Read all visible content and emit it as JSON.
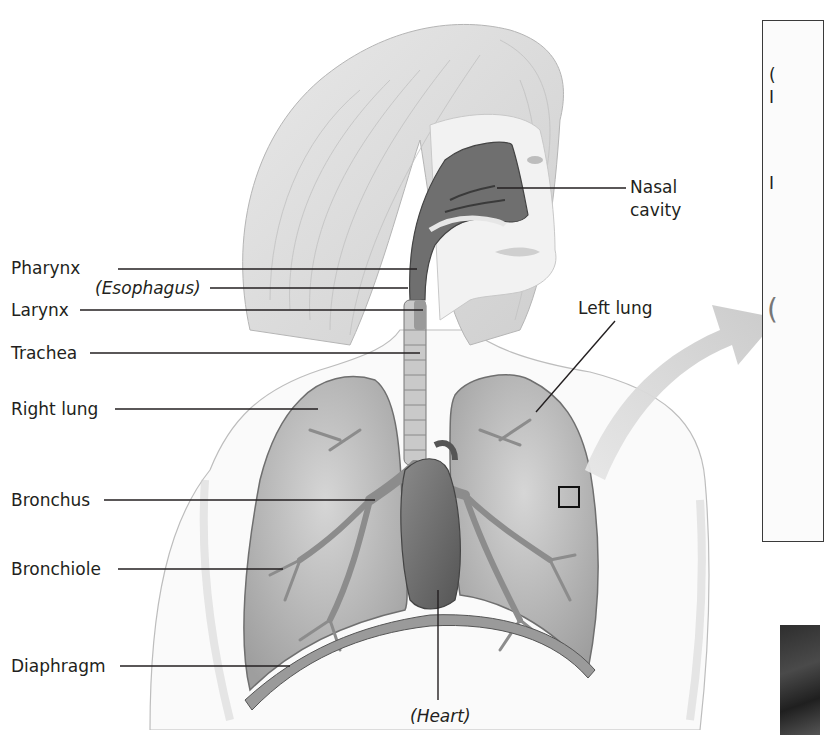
{
  "figure": {
    "labels_left": [
      {
        "id": "pharynx",
        "text": "Pharynx",
        "italic": false
      },
      {
        "id": "esophagus",
        "text": "(Esophagus)",
        "italic": true
      },
      {
        "id": "larynx",
        "text": "Larynx",
        "italic": false
      },
      {
        "id": "trachea",
        "text": "Trachea",
        "italic": false
      },
      {
        "id": "right-lung",
        "text": "Right lung",
        "italic": false
      },
      {
        "id": "bronchus",
        "text": "Bronchus",
        "italic": false
      },
      {
        "id": "bronchiole",
        "text": "Bronchiole",
        "italic": false
      },
      {
        "id": "diaphragm",
        "text": "Diaphragm",
        "italic": false
      }
    ],
    "labels_right": [
      {
        "id": "nasal-cavity",
        "line1": "Nasal",
        "line2": "cavity"
      },
      {
        "id": "left-lung",
        "text": "Left lung"
      }
    ],
    "labels_bottom": [
      {
        "id": "heart",
        "text": "(Heart)",
        "italic": true
      }
    ],
    "inset_panel": {
      "visible_glyphs": [
        "(",
        "I",
        "I",
        "("
      ]
    },
    "colors": {
      "line": "#231f20",
      "arrow": "#cfcfcf",
      "skin_shade": "#d9d9d9",
      "lung_fill": "#bdbdbd",
      "heart_fill": "#6e6e6e",
      "inset_border": "#3a3a3a"
    }
  }
}
